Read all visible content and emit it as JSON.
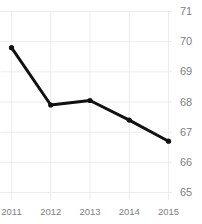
{
  "chart_data": {
    "type": "line",
    "title": "",
    "xlabel": "",
    "ylabel": "",
    "categories": [
      "2011",
      "2012",
      "2013",
      "2014",
      "2015"
    ],
    "values": [
      69.8,
      67.9,
      68.05,
      67.4,
      66.7
    ],
    "series": [
      {
        "name": "series-1",
        "values": [
          69.8,
          67.9,
          68.05,
          67.4,
          66.7
        ],
        "color": "#111111",
        "marker": "circle",
        "line_width": 3
      }
    ],
    "ylim": [
      65,
      71
    ],
    "yticks": [
      65,
      66,
      67,
      68,
      69,
      70,
      71
    ],
    "ytick_labels": [
      "65",
      "66",
      "67",
      "68",
      "69",
      "70",
      "71"
    ],
    "xticks": [
      "2011",
      "2012",
      "2013",
      "2014",
      "2015"
    ],
    "xtick_labels": [
      "2011",
      "2012",
      "2013",
      "2014",
      "2015"
    ],
    "grid": true,
    "grid_color": "#ececed",
    "grid_axis": "both",
    "legend": false,
    "legend_position": "none",
    "y_axis_position": "right",
    "annotations": []
  },
  "axis": {
    "y_labels": [
      "71",
      "70",
      "69",
      "68",
      "67",
      "66",
      "65"
    ],
    "x_labels": [
      "2011",
      "2012",
      "2013",
      "2014",
      "2015"
    ]
  },
  "colors": {
    "line": "#111111",
    "grid": "#ececed",
    "tick_text": "#808080",
    "background": "#ffffff"
  }
}
